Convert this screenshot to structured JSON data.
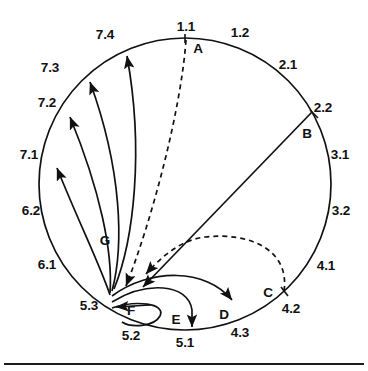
{
  "figure": {
    "background_color": "#ffffff",
    "stroke_color": "#111111",
    "circle": {
      "cx": 185,
      "cy": 184,
      "r": 146
    },
    "bottom_rule": {
      "y": 363,
      "color": "#1b1b1b"
    }
  },
  "sector_labels": [
    {
      "id": "s-1-1",
      "text": "1.1",
      "x": 186,
      "y": 27
    },
    {
      "id": "s-1-2",
      "text": "1.2",
      "x": 240,
      "y": 33
    },
    {
      "id": "s-2-1",
      "text": "2.1",
      "x": 288,
      "y": 65
    },
    {
      "id": "s-2-2",
      "text": "2.2",
      "x": 323,
      "y": 108
    },
    {
      "id": "s-3-1",
      "text": "3.1",
      "x": 340,
      "y": 155
    },
    {
      "id": "s-3-2",
      "text": "3.2",
      "x": 341,
      "y": 211
    },
    {
      "id": "s-4-1",
      "text": "4.1",
      "x": 326,
      "y": 266
    },
    {
      "id": "s-4-2",
      "text": "4.2",
      "x": 291,
      "y": 309
    },
    {
      "id": "s-4-3",
      "text": "4.3",
      "x": 240,
      "y": 333
    },
    {
      "id": "s-5-1",
      "text": "5.1",
      "x": 185,
      "y": 343
    },
    {
      "id": "s-5-2",
      "text": "5.2",
      "x": 131,
      "y": 336
    },
    {
      "id": "s-5-3",
      "text": "5.3",
      "x": 89,
      "y": 306
    },
    {
      "id": "s-6-1",
      "text": "6.1",
      "x": 47,
      "y": 265
    },
    {
      "id": "s-6-2",
      "text": "6.2",
      "x": 31,
      "y": 211
    },
    {
      "id": "s-7-1",
      "text": "7.1",
      "x": 29,
      "y": 155
    },
    {
      "id": "s-7-2",
      "text": "7.2",
      "x": 47,
      "y": 103
    },
    {
      "id": "s-7-3",
      "text": "7.3",
      "x": 50,
      "y": 68
    },
    {
      "id": "s-7-4",
      "text": "7.4",
      "x": 105,
      "y": 35
    }
  ],
  "node_labels": [
    {
      "id": "node-a",
      "text": "A",
      "x": 198,
      "y": 49
    },
    {
      "id": "node-b",
      "text": "B",
      "x": 307,
      "y": 134
    },
    {
      "id": "node-c",
      "text": "C",
      "x": 268,
      "y": 293
    },
    {
      "id": "node-d",
      "text": "D",
      "x": 224,
      "y": 315
    },
    {
      "id": "node-e",
      "text": "E",
      "x": 176,
      "y": 320
    },
    {
      "id": "node-f",
      "text": "F",
      "x": 131,
      "y": 311
    },
    {
      "id": "node-g",
      "text": "G",
      "x": 105,
      "y": 241
    }
  ],
  "edges": [
    {
      "id": "edge-a",
      "label": "A",
      "style": "dashed",
      "from": "1.1",
      "to": "5.3",
      "arrow": "to-5.3"
    },
    {
      "id": "edge-b",
      "label": "B",
      "style": "solid",
      "from": "2.2",
      "to": "5.3",
      "arrow": "to-5.3"
    },
    {
      "id": "edge-c",
      "label": "C",
      "style": "dashed",
      "from": "4.1/4.2",
      "to": "5.3",
      "arrow": "to-5.3"
    },
    {
      "id": "edge-d",
      "label": "D",
      "style": "solid",
      "from": "5.3",
      "to": "4.3",
      "arrow": "to-4.3"
    },
    {
      "id": "edge-e",
      "label": "E",
      "style": "solid",
      "from": "5.3",
      "to": "5.1",
      "arrow": "to-5.1"
    },
    {
      "id": "edge-f",
      "label": "F",
      "style": "solid",
      "from": "5.2",
      "to": "5.3",
      "arrow": "to-5.3"
    },
    {
      "id": "edge-g1",
      "label": "G",
      "style": "solid",
      "from": "5.3",
      "to": "7.1",
      "arrow": "to-7.1"
    },
    {
      "id": "edge-g2",
      "label": "G",
      "style": "solid",
      "from": "5.3",
      "to": "7.2",
      "arrow": "to-7.2"
    },
    {
      "id": "edge-g3",
      "label": "G",
      "style": "solid",
      "from": "5.3",
      "to": "7.3",
      "arrow": "to-7.3"
    },
    {
      "id": "edge-g4",
      "label": "G",
      "style": "solid",
      "from": "5.3",
      "to": "7.4",
      "arrow": "to-7.4"
    }
  ]
}
